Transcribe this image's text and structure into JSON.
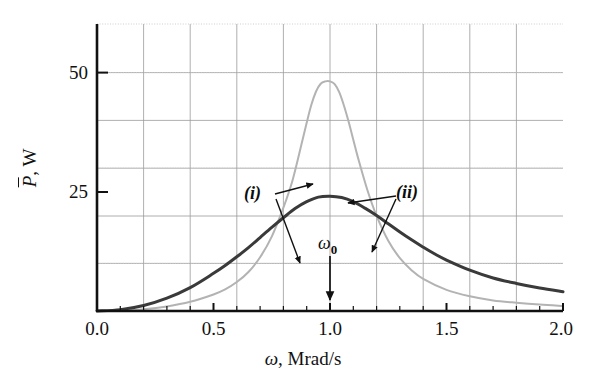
{
  "chart_data": {
    "type": "line",
    "title": "",
    "xlabel": "ω, Mrad/s",
    "ylabel": "P̄, W",
    "xlabel_symbol": "ω",
    "xlabel_unit": ", Mrad/s",
    "ylabel_symbol": "P",
    "ylabel_unit": ", W",
    "xlim": [
      0.0,
      2.0
    ],
    "ylim": [
      0,
      62.5
    ],
    "grid": true,
    "grid_x_step": 0.2,
    "grid_y_step": 12.5,
    "legend_position": "annotations-inline",
    "xticks": [
      0.0,
      0.5,
      1.0,
      1.5,
      2.0
    ],
    "xtick_labels": [
      "0.0",
      "0.5",
      "1.0",
      "1.5",
      "2.0"
    ],
    "yticks": [
      25,
      50
    ],
    "ytick_labels": [
      "25",
      "50"
    ],
    "x_minor_ticks": [
      0.1,
      0.2,
      0.3,
      0.4,
      0.6,
      0.7,
      0.8,
      0.9,
      1.1,
      1.2,
      1.3,
      1.4,
      1.6,
      1.7,
      1.8,
      1.9
    ],
    "resonance": {
      "omega_0": 1.0,
      "label": "ω",
      "subscript": "0"
    },
    "series": [
      {
        "name": "(i)",
        "label": "(i)",
        "color": "#b3b3b3",
        "peak_x": 1.0,
        "peak_y": 50,
        "bandwidth": 0.08,
        "linewidth": 2.0,
        "x": [
          0.0,
          0.1,
          0.2,
          0.3,
          0.4,
          0.5,
          0.55,
          0.6,
          0.65,
          0.7,
          0.75,
          0.8,
          0.84,
          0.88,
          0.9,
          0.92,
          0.94,
          0.96,
          0.98,
          1.0,
          1.02,
          1.04,
          1.06,
          1.08,
          1.1,
          1.12,
          1.16,
          1.2,
          1.25,
          1.3,
          1.35,
          1.4,
          1.5,
          1.6,
          1.7,
          1.8,
          1.9,
          2.0
        ],
        "y": [
          0.0,
          0.1,
          0.4,
          1.0,
          2.0,
          3.6,
          4.7,
          6.3,
          8.5,
          11.7,
          16.2,
          22.5,
          28.6,
          36.8,
          41.0,
          44.9,
          47.8,
          49.5,
          50.0,
          50.0,
          49.4,
          47.6,
          44.7,
          41.2,
          37.3,
          33.4,
          26.4,
          20.7,
          15.3,
          11.5,
          8.9,
          7.0,
          4.6,
          3.2,
          2.3,
          1.8,
          1.4,
          1.1
        ]
      },
      {
        "name": "(ii)",
        "label": "(ii)",
        "color": "#3a3a3a",
        "peak_x": 1.0,
        "peak_y": 25,
        "bandwidth": 0.3,
        "linewidth": 3.0,
        "x": [
          0.0,
          0.1,
          0.2,
          0.3,
          0.4,
          0.5,
          0.55,
          0.6,
          0.65,
          0.7,
          0.75,
          0.8,
          0.85,
          0.9,
          0.95,
          1.0,
          1.05,
          1.1,
          1.15,
          1.2,
          1.25,
          1.3,
          1.35,
          1.4,
          1.45,
          1.5,
          1.6,
          1.7,
          1.8,
          1.9,
          2.0
        ],
        "y": [
          0.0,
          0.3,
          1.2,
          2.8,
          5.1,
          8.2,
          9.9,
          11.8,
          13.8,
          16.0,
          18.2,
          20.3,
          22.3,
          23.8,
          24.8,
          25.0,
          24.7,
          23.8,
          22.4,
          20.8,
          19.0,
          17.2,
          15.5,
          13.9,
          12.4,
          11.1,
          8.9,
          7.2,
          6.0,
          5.0,
          4.2
        ]
      }
    ],
    "annotations": [
      {
        "text": "(i)",
        "x_px": 251,
        "y_px": 186,
        "kind": "series-label"
      },
      {
        "text": "(ii)",
        "x_px": 398,
        "y_px": 185,
        "kind": "series-label"
      },
      {
        "text": "ω",
        "subscript": "0",
        "x_px": 320,
        "y_px": 238,
        "kind": "resonance-label"
      }
    ]
  },
  "plot_box": {
    "left": 97,
    "top": 24,
    "right": 563,
    "bottom": 311
  }
}
